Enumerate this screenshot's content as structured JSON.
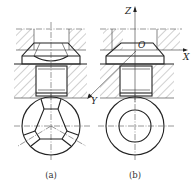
{
  "figure": {
    "type": "engineering drawing",
    "views": [
      {
        "id": "a",
        "caption": "(a)",
        "description": "Section view with faceted cone head; plan view showing three radial facets"
      },
      {
        "id": "b",
        "caption": "(b)",
        "description": "Section view with conical head and coordinate frame; plan view as two concentric circles"
      }
    ],
    "axes": {
      "z_label": "Z",
      "x_label": "X",
      "y_label": "Y",
      "origin_label": "O"
    },
    "colors": {
      "line": "#222222",
      "hatch": "#555555",
      "background": "#ffffff"
    }
  }
}
